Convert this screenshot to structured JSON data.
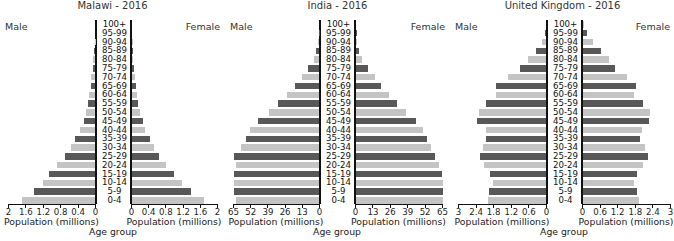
{
  "chart_data": [
    {
      "type": "bar",
      "orientation": "horizontal-pyramid",
      "title": "Malawi - 2016",
      "xlabel": "Population (millions)",
      "ylabel": "Age group",
      "left_label": "Male",
      "right_label": "Female",
      "xlim": [
        0,
        2
      ],
      "ticks": [
        "0",
        "0.4",
        "0.8",
        "1.2",
        "1.6",
        "2"
      ],
      "categories": [
        "100+",
        "95-99",
        "90-94",
        "85-89",
        "80-84",
        "75-79",
        "70-74",
        "65-69",
        "60-64",
        "55-59",
        "50-54",
        "45-49",
        "40-44",
        "35-39",
        "30-34",
        "25-29",
        "20-24",
        "15-19",
        "10-14",
        "5-9",
        "0-4"
      ],
      "series": [
        {
          "name": "Male",
          "values": [
            0,
            0,
            0,
            0.01,
            0.02,
            0.05,
            0.05,
            0.1,
            0.1,
            0.13,
            0.17,
            0.21,
            0.25,
            0.34,
            0.45,
            0.55,
            0.7,
            0.87,
            1.05,
            1.2,
            1.4,
            1.68
          ]
        },
        {
          "name": "Female",
          "values": [
            0,
            0,
            0.01,
            0.01,
            0.02,
            0.05,
            0.06,
            0.1,
            0.11,
            0.14,
            0.18,
            0.25,
            0.3,
            0.42,
            0.52,
            0.62,
            0.8,
            0.97,
            1.17,
            1.38,
            1.68
          ]
        }
      ]
    },
    {
      "type": "bar",
      "orientation": "horizontal-pyramid",
      "title": "India - 2016",
      "xlabel": "Population (millions)",
      "ylabel": "Age group",
      "left_label": "Male",
      "right_label": "Female",
      "xlim": [
        0,
        65
      ],
      "ticks": [
        "0",
        "13",
        "26",
        "39",
        "52",
        "65"
      ],
      "categories": [
        "100+",
        "95-99",
        "90-94",
        "85-89",
        "80-84",
        "75-79",
        "70-74",
        "65-69",
        "60-64",
        "55-59",
        "50-54",
        "45-49",
        "40-44",
        "35-39",
        "30-34",
        "25-29",
        "20-24",
        "15-19",
        "10-14",
        "5-9",
        "0-4"
      ],
      "series": [
        {
          "name": "Male",
          "values": [
            0,
            0.3,
            1,
            2,
            4,
            8,
            13,
            18,
            24,
            31,
            38,
            46,
            52,
            55,
            59,
            64,
            63,
            64,
            64,
            64,
            63
          ]
        },
        {
          "name": "Female",
          "values": [
            0,
            0.3,
            1,
            2.5,
            4.5,
            9,
            14,
            19,
            25,
            31,
            37,
            45,
            50,
            53,
            56,
            59,
            62,
            64,
            65,
            65,
            65
          ]
        }
      ]
    },
    {
      "type": "bar",
      "orientation": "horizontal-pyramid",
      "title": "United Kingdom - 2016",
      "xlabel": "Population (millions)",
      "ylabel": "Age group",
      "left_label": "Male",
      "right_label": "Female",
      "xlim": [
        0,
        3
      ],
      "ticks": [
        "0",
        "0.6",
        "1.2",
        "1.8",
        "2.4",
        "3"
      ],
      "categories": [
        "100+",
        "95-99",
        "90-94",
        "85-89",
        "80-84",
        "75-79",
        "70-74",
        "65-69",
        "60-64",
        "55-59",
        "50-54",
        "45-49",
        "40-44",
        "35-39",
        "30-34",
        "25-29",
        "20-24",
        "15-19",
        "10-14",
        "5-9",
        "0-4"
      ],
      "series": [
        {
          "name": "Male",
          "values": [
            0.01,
            0.05,
            0.15,
            0.35,
            0.6,
            0.9,
            1.3,
            1.7,
            1.7,
            2.05,
            2.3,
            2.35,
            2.05,
            2.05,
            2.15,
            2.25,
            2.1,
            1.9,
            1.8,
            1.95,
            1.98
          ]
        },
        {
          "name": "Female",
          "values": [
            0.02,
            0.12,
            0.35,
            0.6,
            0.9,
            1.1,
            1.5,
            1.8,
            1.75,
            2.05,
            2.3,
            2.25,
            2.0,
            1.95,
            2.1,
            2.2,
            2.05,
            1.85,
            1.75,
            1.85,
            1.9
          ]
        }
      ]
    }
  ],
  "panels": [
    {
      "title": "Malawi - 2016",
      "male": "Male",
      "female": "Female",
      "xlabel_left": "Population (millions)",
      "xlabel_right": "Population (millions)",
      "age_title": "Age group",
      "ticks_left": [
        "2",
        "1.6",
        "1.2",
        "0.8",
        "0.4",
        "0"
      ],
      "ticks_right": [
        "0",
        "0.4",
        "0.8",
        "1.2",
        "1.6",
        "2"
      ]
    },
    {
      "title": "India - 2016",
      "male": "Male",
      "female": "Female",
      "xlabel_left": "Population (millions)",
      "xlabel_right": "Population (millions)",
      "age_title": "Age group",
      "ticks_left": [
        "65",
        "52",
        "39",
        "26",
        "13",
        "0"
      ],
      "ticks_right": [
        "0",
        "13",
        "26",
        "39",
        "52",
        "65"
      ]
    },
    {
      "title": "United Kingdom - 2016",
      "male": "Male",
      "female": "Female",
      "xlabel_left": "Population (millions)",
      "xlabel_right": "Population (millions)",
      "age_title": "Age group",
      "ticks_left": [
        "3",
        "2.4",
        "1.8",
        "1.2",
        "0.6",
        "0"
      ],
      "ticks_right": [
        "0",
        "0.6",
        "1.2",
        "1.8",
        "2.4",
        "3"
      ]
    }
  ],
  "colors": {
    "dark": "#585858",
    "light": "#c4c4c4",
    "axis": "#111111"
  }
}
